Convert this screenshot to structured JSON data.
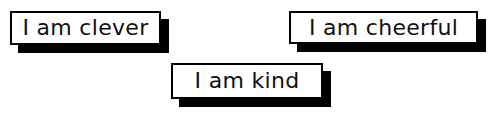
{
  "cards": [
    {
      "text": "I am clever"
    },
    {
      "text": "I am cheerful"
    },
    {
      "text": "I am kind"
    }
  ],
  "colors": {
    "background": "#ffffff",
    "border": "#000000",
    "shadow": "#000000",
    "text": "#111111"
  }
}
